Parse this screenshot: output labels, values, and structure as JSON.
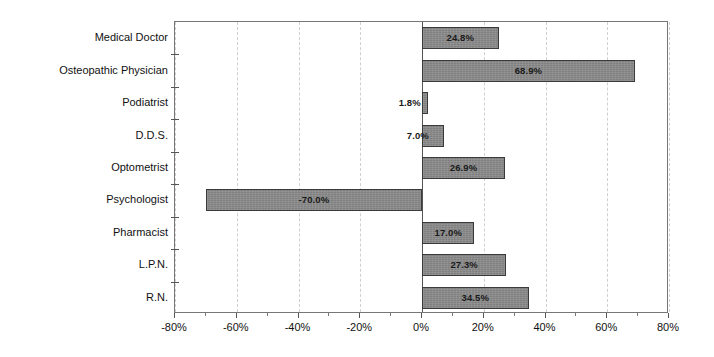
{
  "chart_data": {
    "type": "bar",
    "orientation": "horizontal",
    "title": "",
    "subtitle": "",
    "xlabel": "",
    "ylabel": "",
    "xlim": [
      -80,
      80
    ],
    "xtick_labels": [
      "-80%",
      "-60%",
      "-40%",
      "-20%",
      "0%",
      "20%",
      "40%",
      "60%",
      "80%"
    ],
    "xtick_values": [
      -80,
      -60,
      -40,
      -20,
      0,
      20,
      40,
      60,
      80
    ],
    "minor_tick_step": 10,
    "grid": "vertical-dashed-at-major-ticks",
    "legend": "none",
    "value_label_format": "percent-one-decimal",
    "bar_color": "#808080",
    "bar_border_color": "#3a3a3a",
    "categories": [
      "Medical Doctor",
      "Osteopathic Physician",
      "Podiatrist",
      "D.D.S.",
      "Optometrist",
      "Psychologist",
      "Pharmacist",
      "L.P.N.",
      "R.N."
    ],
    "values": [
      24.8,
      68.9,
      1.8,
      7.0,
      26.9,
      -70.0,
      17.0,
      27.3,
      34.5
    ],
    "value_labels": [
      "24.8%",
      "68.9%",
      "1.8%",
      "7.0%",
      "26.9%",
      "-70.0%",
      "17.0%",
      "27.3%",
      "34.5%"
    ]
  }
}
